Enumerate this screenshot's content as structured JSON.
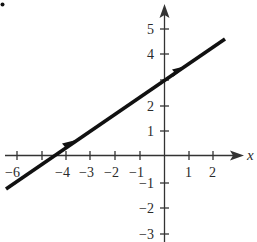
{
  "figure": {
    "marker_dot": true,
    "x_axis": {
      "label": "x",
      "ticks": [
        -6,
        -5,
        -4,
        -3,
        -2,
        -1,
        1,
        2
      ],
      "tick_labels": [
        "−6",
        "−4",
        "−3",
        "−2",
        "−1",
        "1",
        "2"
      ],
      "labeled_values": [
        -6,
        -4,
        -3,
        -2,
        -1,
        1,
        2
      ]
    },
    "y_axis": {
      "ticks": [
        5,
        4,
        3,
        2,
        1,
        -1,
        -2,
        -3
      ],
      "tick_labels": [
        "5",
        "4",
        "2",
        "1",
        "−1",
        "−2",
        "−3"
      ],
      "labeled_values": [
        5,
        4,
        2,
        1,
        -1,
        -2,
        -3
      ]
    },
    "line": {
      "equation": "y = (2/3)x + 3",
      "slope": 0.6667,
      "y_intercept": 3,
      "x_intercept": -4.5,
      "direction_arrows": 2,
      "color": "#111111"
    },
    "colors": {
      "axis": "#333333",
      "text": "#2a2a2a",
      "background": "#ffffff"
    }
  }
}
